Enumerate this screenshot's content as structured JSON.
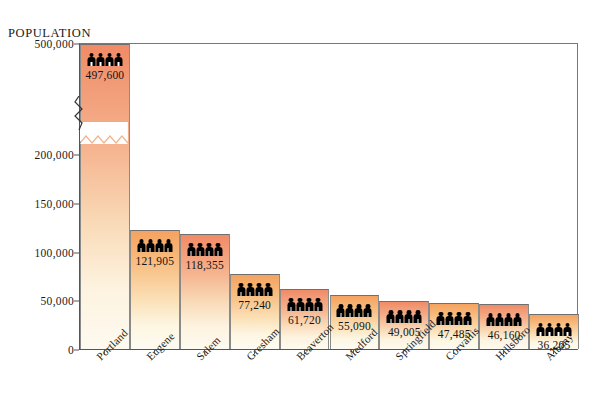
{
  "chart_data": {
    "type": "bar",
    "title": "POPULATION",
    "xlabel": "",
    "ylabel": "POPULATION",
    "categories": [
      "Portland",
      "Eugene",
      "Salem",
      "Gresham",
      "Beaverton",
      "Medford",
      "Springfield",
      "Corvallis",
      "Hillsboro",
      "Albany"
    ],
    "values": [
      497600,
      121905,
      118355,
      77240,
      61720,
      55090,
      49005,
      47485,
      46160,
      36205
    ],
    "value_labels": [
      "497,600",
      "121,905",
      "118,355",
      "77,240",
      "61,720",
      "55,090",
      "49,005",
      "47,485",
      "46,160",
      "36,205"
    ],
    "ytick_labels": [
      "0",
      "50,000",
      "100,000",
      "150,000",
      "200,000",
      "500,000"
    ],
    "ytick_values": [
      0,
      50000,
      100000,
      150000,
      200000,
      500000
    ],
    "ylim": [
      0,
      500000
    ],
    "axis_break": true,
    "axis_break_between": [
      200000,
      500000
    ],
    "grid": false,
    "legend": null,
    "annotations": [
      {
        "text": "TOTAL POPULATION:",
        "position": "top-right"
      },
      {
        "text": "3,132,000  (1995 estimated)",
        "position": "top-right"
      }
    ],
    "bar_colors": [
      "#f08b66",
      "#f4a261",
      "#f08b66",
      "#f4a261",
      "#f08b66",
      "#f4a261",
      "#f08b66",
      "#f4a261",
      "#f08b66",
      "#f4a261"
    ],
    "icon_per_bar": "person-icon",
    "icons_per_bar_count": 4
  },
  "annotation": {
    "total_head": "TOTAL POPULATION:",
    "total_sub": "3,132,000  (1995 estimated)"
  },
  "axis": {
    "ylabel": "POPULATION"
  },
  "colors": {
    "warm_top": "#f08b66",
    "gold_top": "#f4a261",
    "bar_bottom": "#fdfaf0",
    "frame": "#555555",
    "icon": "#000000",
    "background": "#ffffff"
  }
}
